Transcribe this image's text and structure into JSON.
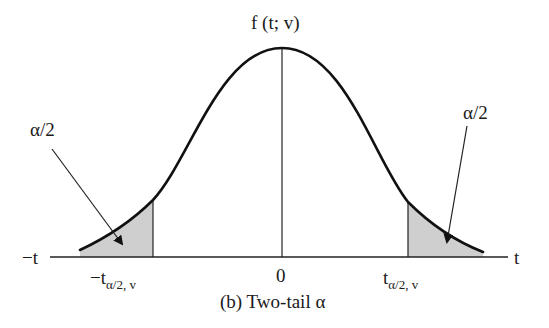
{
  "figure": {
    "caption": "(b) Two-tail α",
    "y_axis_label": "f (t; v)",
    "x_axis_left_label": "−t",
    "x_axis_right_label": "t",
    "center_tick": "0",
    "left_critical": {
      "main": "−t",
      "sub": "α/2, v"
    },
    "right_critical": {
      "main": "t",
      "sub": "α/2, v"
    },
    "left_tail_label": "α/2",
    "right_tail_label": "α/2",
    "colors": {
      "curve": "#111111",
      "shade": "#cfcfcf",
      "axis": "#222222"
    }
  }
}
